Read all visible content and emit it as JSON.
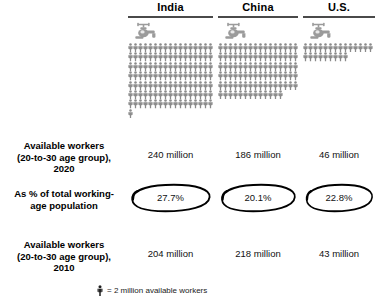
{
  "chart_data": {
    "type": "table",
    "categories": [
      "India",
      "China",
      "U.S."
    ],
    "series": [
      {
        "name": "Available workers (20-to-30 age group), 2020",
        "unit": "million",
        "values": [
          240,
          186,
          46
        ],
        "labels": [
          "240 million",
          "186 million",
          "46 million"
        ]
      },
      {
        "name": "As % of total working-age population",
        "unit": "%",
        "values": [
          27.7,
          20.1,
          22.8
        ],
        "labels": [
          "27.7%",
          "20.1%",
          "22.8%"
        ]
      },
      {
        "name": "Available workers (20-to-30 age group), 2010",
        "unit": "million",
        "values": [
          204,
          218,
          43
        ],
        "labels": [
          "204 million",
          "218 million",
          "43 million"
        ]
      }
    ],
    "pictogram": {
      "icon": "person-icon",
      "unit_value": 2,
      "unit_label": "million",
      "counts": [
        120,
        93,
        23
      ],
      "per_row": 15,
      "grid": {
        "India": {
          "rows": 8,
          "full_rows": 8,
          "last_row": 15
        },
        "China": {
          "rows": 7,
          "full_rows": 6,
          "last_row": 3
        },
        "U.S.": {
          "rows": 2,
          "full_rows": 1,
          "last_row": 8
        }
      }
    },
    "legend": {
      "label": "= 2 million available workers"
    },
    "colors": {
      "person": "#8a8a8a",
      "faucet": "#9b9b9b",
      "rule": "#4a4a4a",
      "text": "#000000",
      "oval": "#000000",
      "background": "#ffffff"
    },
    "grid": false,
    "xlabel": "",
    "ylabel": ""
  },
  "header": {
    "columns": [
      {
        "label": "India"
      },
      {
        "label": "China"
      },
      {
        "label": "U.S."
      }
    ]
  },
  "rows": {
    "workers_2020": {
      "label_line1": "Available workers",
      "label_line2": "(20-to-30 age group),",
      "label_line3": "2020",
      "values": [
        "240 million",
        "186 million",
        "46 million"
      ]
    },
    "pct_working_age": {
      "label_line1": "As % of total working-",
      "label_line2": "age population",
      "values": [
        "27.7%",
        "20.1%",
        "22.8%"
      ]
    },
    "workers_2010": {
      "label_line1": "Available workers",
      "label_line2": "(20-to-30 age group),",
      "label_line3": "2010",
      "values": [
        "204 million",
        "218 million",
        "43 million"
      ]
    }
  },
  "legend": {
    "text": "= 2 million available workers"
  }
}
